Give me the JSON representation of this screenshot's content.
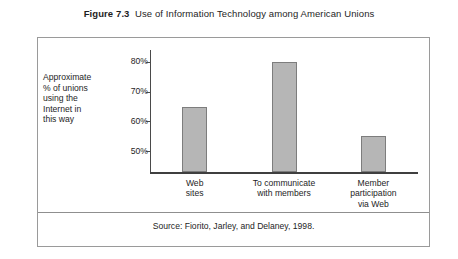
{
  "figure": {
    "number_label": "Figure 7.3",
    "title": "Use of Information Technology among American Unions",
    "source_note": "Source:  Fiorito, Jarley, and Delaney, 1998.",
    "axis_caption_lines": [
      "Approximate",
      "% of unions",
      "using the",
      "Internet in",
      "this way"
    ]
  },
  "colors": {
    "bar_fill": "#b6b6b6",
    "bar_stroke": "#7d7d7d",
    "axis": "#4a4a4a",
    "frame": "#9a9a9a",
    "text": "#1e1e1e"
  },
  "chart_data": {
    "type": "bar",
    "title": "Use of Information Technology among American Unions",
    "xlabel": "",
    "ylabel": "Approximate % of unions using the Internet in this way",
    "categories": [
      "Web sites",
      "To communicate with members",
      "Member participation via Web"
    ],
    "category_label_lines": [
      [
        "Web",
        "sites"
      ],
      [
        "To communicate",
        "with members"
      ],
      [
        "Member",
        "participation",
        "via Web"
      ]
    ],
    "values": [
      65,
      80,
      55
    ],
    "value_unit": "%",
    "ylim": [
      43,
      84
    ],
    "yticks": [
      50,
      60,
      70,
      80
    ],
    "ytick_labels": [
      "50%",
      "60%",
      "70%",
      "80%"
    ],
    "grid": false,
    "legend": null,
    "source": "Fiorito, Jarley, and Delaney, 1998."
  }
}
